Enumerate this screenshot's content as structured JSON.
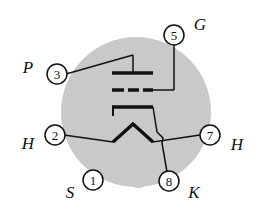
{
  "diagram": {
    "type": "vacuum-tube-base-pinout",
    "tube": "triode",
    "colors": {
      "base": "#c9c9c9",
      "ink": "#111111",
      "background": "#ffffff"
    },
    "pins": [
      {
        "number": "1",
        "label": "S",
        "meaning": "shield"
      },
      {
        "number": "2",
        "label": "H",
        "meaning": "heater"
      },
      {
        "number": "3",
        "label": "P",
        "meaning": "plate"
      },
      {
        "number": "5",
        "label": "G",
        "meaning": "grid"
      },
      {
        "number": "7",
        "label": "H",
        "meaning": "heater"
      },
      {
        "number": "8",
        "label": "K",
        "meaning": "cathode"
      }
    ]
  }
}
